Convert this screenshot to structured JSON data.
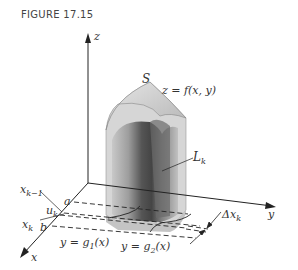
{
  "figure": {
    "title": "FIGURE 17.15"
  },
  "labels": {
    "z_axis": "z",
    "y_axis": "y",
    "x_axis": "x",
    "surface": "S",
    "surface_eq": "z = f(x, y)",
    "line": "L",
    "line_sub": "k",
    "x_k_minus_1": "x",
    "x_k_minus_1_sub": "k−1",
    "u_k": "u",
    "u_k_sub": "k",
    "x_k": "x",
    "x_k_sub": "k",
    "a": "a",
    "b": "b",
    "g1": "y = g",
    "g1_sub": "1",
    "g1_tail": "(x)",
    "g2": "y = g",
    "g2_sub": "2",
    "g2_tail": "(x)",
    "delta_x": "Δx",
    "delta_x_sub": "k"
  },
  "colors": {
    "axis": "#222222",
    "solid_light": "#d4d4d4",
    "solid_mid": "#a8a8a8",
    "solid_dark": "#555555",
    "text": "#333333"
  }
}
